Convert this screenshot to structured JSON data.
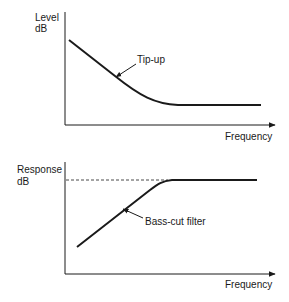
{
  "diagram": {
    "colors": {
      "ink": "#1a1a1a",
      "background": "#ffffff"
    },
    "top_chart": {
      "y_label_line1": "Level",
      "y_label_line2": "dB",
      "x_label": "Frequency",
      "curve_label": "Tip-up"
    },
    "bottom_chart": {
      "y_label_line1": "Response",
      "y_label_line2": "dB",
      "x_label": "Frequency",
      "curve_label": "Bass-cut filter"
    }
  }
}
